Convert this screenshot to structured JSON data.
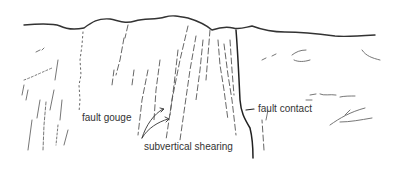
{
  "figure": {
    "type": "geological field sketch",
    "labels": {
      "fault_gouge": "fault gouge",
      "subvertical_shearing": "subvertical shearing",
      "fault_contact": "fault contact"
    },
    "colors": {
      "background": "#ffffff",
      "ink": "#333333",
      "light_ink": "#777777"
    }
  }
}
